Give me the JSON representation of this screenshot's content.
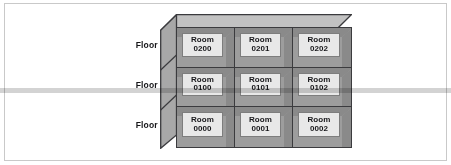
{
  "figure": {
    "type": "isometric-grid"
  },
  "floors": [
    {
      "label": "Floor 02"
    },
    {
      "label": "Floor 01"
    },
    {
      "label": "Floor 00"
    }
  ],
  "rooms": {
    "word": "Room",
    "grid": [
      [
        {
          "word": "Room",
          "number": "0200"
        },
        {
          "word": "Room",
          "number": "0201"
        },
        {
          "word": "Room",
          "number": "0202"
        }
      ],
      [
        {
          "word": "Room",
          "number": "0100"
        },
        {
          "word": "Room",
          "number": "0101"
        },
        {
          "word": "Room",
          "number": "0102"
        }
      ],
      [
        {
          "word": "Room",
          "number": "0000"
        },
        {
          "word": "Room",
          "number": "0001"
        },
        {
          "word": "Room",
          "number": "0002"
        }
      ]
    ]
  },
  "colors": {
    "frame_border": "#c9c9c9",
    "cell_fill": "#9d9d9d",
    "cell_stroke": "#3b3b3e",
    "panel_fill": "#e8e8e8",
    "panel_stroke": "#7d7d7d",
    "top_face": "#c2c2c2",
    "left_face": "#a8a8a8",
    "text": "#17171a",
    "page_background": "#ffffff"
  }
}
